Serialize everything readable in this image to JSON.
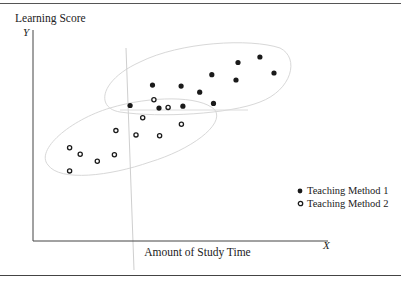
{
  "chart_data": {
    "type": "scatter",
    "title": "",
    "xlabel": "Amount of Study Time",
    "ylabel": "Learning Score",
    "x_axis_letter": "X",
    "y_axis_letter": "Y",
    "xlim": [
      0,
      100
    ],
    "ylim": [
      0,
      100
    ],
    "grid": false,
    "ticks": "none",
    "legend_position": "lower right",
    "series": [
      {
        "name": "Teaching Method 1",
        "marker": "filled-circle",
        "color": "#1a1a1a",
        "points": [
          [
            32.9,
            64.2
          ],
          [
            40.5,
            73.9
          ],
          [
            42.7,
            63.0
          ],
          [
            50.2,
            73.4
          ],
          [
            50.8,
            63.9
          ],
          [
            56.5,
            70.5
          ],
          [
            60.6,
            78.8
          ],
          [
            61.2,
            65.2
          ],
          [
            68.8,
            76.3
          ],
          [
            69.5,
            84.6
          ],
          [
            76.9,
            87.2
          ],
          [
            81.7,
            79.6
          ]
        ]
      },
      {
        "name": "Teaching Method 2",
        "marker": "open-circle",
        "color": "#1a1a1a",
        "points": [
          [
            12.4,
            44.2
          ],
          [
            12.4,
            33.2
          ],
          [
            16.0,
            41.1
          ],
          [
            21.8,
            37.8
          ],
          [
            27.6,
            40.9
          ],
          [
            28.1,
            52.3
          ],
          [
            34.9,
            50.3
          ],
          [
            37.2,
            58.4
          ],
          [
            41.0,
            66.9
          ],
          [
            42.9,
            49.9
          ],
          [
            45.8,
            63.3
          ],
          [
            50.3,
            55.3
          ]
        ]
      }
    ],
    "annotations": [
      "faint vertical reference line near x=31",
      "faint horizontal reference line near y=62",
      "faint ellipse enclosing Teaching Method 1 points",
      "faint ellipse enclosing Teaching Method 2 points"
    ]
  },
  "labels": {
    "ylabel": "Learning Score",
    "y_letter": "Y",
    "x_letter": "X",
    "xlabel": "Amount of Study Time",
    "legend": [
      "Teaching Method 1",
      "Teaching Method 2"
    ]
  }
}
